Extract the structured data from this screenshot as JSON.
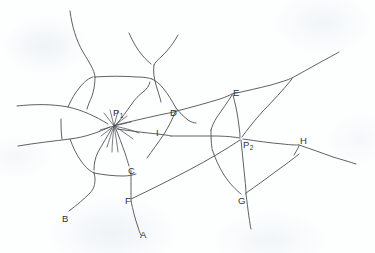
{
  "figure": {
    "kind": "hand-drawn-network-diagram",
    "title": "",
    "width": 375,
    "height": 253,
    "background_color": "#fdfefe",
    "ink_color": "#4c5054",
    "label_color": "#2d3134"
  },
  "labels": [
    {
      "id": "P1",
      "text": "P",
      "sub": "1",
      "role": "hub-node",
      "x": 113,
      "y": 113
    },
    {
      "id": "P2",
      "text": "P",
      "sub": "2",
      "role": "hub-node",
      "x": 243,
      "y": 141
    },
    {
      "id": "A",
      "text": "A",
      "sub": "",
      "role": "endpoint",
      "x": 140,
      "y": 230
    },
    {
      "id": "B",
      "text": "B",
      "sub": "",
      "role": "endpoint",
      "x": 62,
      "y": 214
    },
    {
      "id": "C",
      "text": "C",
      "sub": "",
      "role": "junction",
      "x": 128,
      "y": 168
    },
    {
      "id": "D",
      "text": "D",
      "sub": "",
      "role": "junction",
      "x": 170,
      "y": 110
    },
    {
      "id": "E",
      "text": "E",
      "sub": "",
      "role": "junction",
      "x": 233,
      "y": 90
    },
    {
      "id": "F",
      "text": "F",
      "sub": "",
      "role": "junction",
      "x": 129,
      "y": 198
    },
    {
      "id": "G",
      "text": "G",
      "sub": "",
      "role": "junction",
      "x": 240,
      "y": 198
    },
    {
      "id": "H",
      "text": "H",
      "sub": "",
      "role": "junction",
      "x": 300,
      "y": 140
    },
    {
      "id": "I",
      "text": "I",
      "sub": "",
      "role": "junction",
      "x": 155,
      "y": 131
    }
  ],
  "network": {
    "hub_nodes": [
      "P1",
      "P2"
    ],
    "labeled_points": [
      "A",
      "B",
      "C",
      "D",
      "E",
      "F",
      "G",
      "H",
      "I"
    ],
    "p1_radiating_branches": 12,
    "edges": [
      {
        "from": "left-edge",
        "to": "P1"
      },
      {
        "from": "left-edge-lower",
        "to": "P1"
      },
      {
        "from": "P1",
        "to": "D"
      },
      {
        "from": "P1",
        "to": "I"
      },
      {
        "from": "P1",
        "to": "C"
      },
      {
        "from": "P1",
        "to": "top-branch-1"
      },
      {
        "from": "P1",
        "to": "top-branch-2"
      },
      {
        "from": "C",
        "to": "F"
      },
      {
        "from": "F",
        "to": "A"
      },
      {
        "from": "C",
        "to": "B"
      },
      {
        "from": "D",
        "to": "E"
      },
      {
        "from": "I",
        "to": "P2"
      },
      {
        "from": "E",
        "to": "P2"
      },
      {
        "from": "E",
        "to": "top-right-branch"
      },
      {
        "from": "P2",
        "to": "H"
      },
      {
        "from": "P2",
        "to": "G"
      },
      {
        "from": "G",
        "to": "bottom-right"
      },
      {
        "from": "H",
        "to": "right-edge"
      },
      {
        "from": "F",
        "to": "P2",
        "note": "long diagonal"
      }
    ]
  }
}
